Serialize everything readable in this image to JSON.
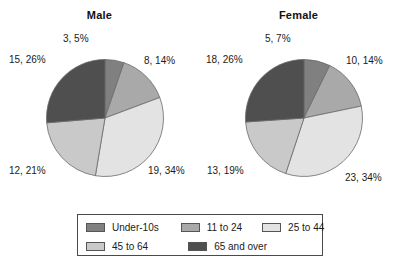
{
  "legend": {
    "position": "bottom",
    "entries": [
      {
        "label": "Under-10s",
        "color": "#808080"
      },
      {
        "label": "11 to 24",
        "color": "#a9a9a9"
      },
      {
        "label": "25 to 44",
        "color": "#e3e3e3"
      },
      {
        "label": "45 to 64",
        "color": "#c9c9c9"
      },
      {
        "label": "65 and over",
        "color": "#4f4f4f"
      }
    ]
  },
  "charts": [
    {
      "title": "Male",
      "labels": [
        "3, 5%",
        "8, 14%",
        "19, 34%",
        "12, 21%",
        "15, 26%"
      ]
    },
    {
      "title": "Female",
      "labels": [
        "5, 7%",
        "10, 14%",
        "23, 34%",
        "13, 19%",
        "18, 26%"
      ]
    }
  ],
  "chart_data": [
    {
      "type": "pie",
      "title": "Male",
      "categories": [
        "Under-10s",
        "11 to 24",
        "25 to 44",
        "45 to 64",
        "65 and over"
      ],
      "values": [
        3,
        8,
        19,
        12,
        15
      ],
      "percents": [
        5,
        14,
        34,
        21,
        26
      ],
      "total": 57,
      "data_labels": [
        "3, 5%",
        "8, 14%",
        "19, 34%",
        "12, 21%",
        "15, 26%"
      ],
      "colors": [
        "#808080",
        "#a9a9a9",
        "#e3e3e3",
        "#c9c9c9",
        "#4f4f4f"
      ],
      "start_angle_deg": 0,
      "direction": "clockwise",
      "legend": "bottom",
      "grid": false
    },
    {
      "type": "pie",
      "title": "Female",
      "categories": [
        "Under-10s",
        "11 to 24",
        "25 to 44",
        "45 to 64",
        "65 and over"
      ],
      "values": [
        5,
        10,
        23,
        13,
        18
      ],
      "percents": [
        7,
        14,
        34,
        19,
        26
      ],
      "total": 69,
      "data_labels": [
        "5, 7%",
        "10, 14%",
        "23, 34%",
        "13, 19%",
        "18, 26%"
      ],
      "colors": [
        "#808080",
        "#a9a9a9",
        "#e3e3e3",
        "#c9c9c9",
        "#4f4f4f"
      ],
      "start_angle_deg": 0,
      "direction": "clockwise",
      "legend": "bottom",
      "grid": false
    }
  ]
}
